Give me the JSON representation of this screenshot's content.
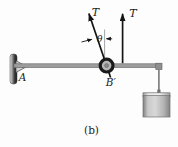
{
  "figure": {
    "caption": "(b)",
    "labels": {
      "tension_angled": "T",
      "tension_vertical": "T",
      "angle": "θ",
      "support_point": "A",
      "pulley_point": "B′"
    },
    "colors": {
      "background": "#fdfdfd",
      "beam": "#9c9c9c",
      "beam_edge": "#6a6a6a",
      "arrow": "#141414",
      "reference_line": "#9a9a9a",
      "pulley_ring": "#1a1a1a",
      "pulley_face": "#b6b6b6",
      "rope": "#808080",
      "text": "#1c1c1c"
    }
  }
}
